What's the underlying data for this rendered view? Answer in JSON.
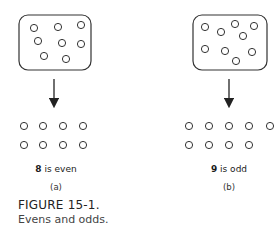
{
  "figure": {
    "title": "FIGURE 15-1.",
    "caption": "Evens and odds."
  },
  "panels": [
    {
      "id": "a",
      "count": "8",
      "label_suffix": " is even",
      "sublabel": "(a)",
      "box_circles": [
        [
          34,
          28
        ],
        [
          58,
          27
        ],
        [
          81,
          25
        ],
        [
          38,
          41
        ],
        [
          62,
          43
        ],
        [
          81,
          44
        ],
        [
          44,
          56
        ],
        [
          66,
          59
        ]
      ],
      "paired_rows": [
        [
          24,
          43,
          63,
          83
        ],
        [
          24,
          43,
          63,
          83
        ]
      ]
    },
    {
      "id": "b",
      "count": "9",
      "label_suffix": " is odd",
      "sublabel": "(b)",
      "box_circles": [
        [
          205,
          27
        ],
        [
          221,
          32
        ],
        [
          235,
          24
        ],
        [
          254,
          26
        ],
        [
          243,
          36
        ],
        [
          205,
          49
        ],
        [
          225,
          51
        ],
        [
          252,
          52
        ],
        [
          236,
          61
        ]
      ],
      "paired_rows": [
        [
          189,
          209,
          229,
          249,
          270
        ],
        [
          189,
          209,
          229,
          249
        ]
      ]
    }
  ],
  "colors": {
    "stroke": "#333333",
    "background": "#ffffff"
  }
}
